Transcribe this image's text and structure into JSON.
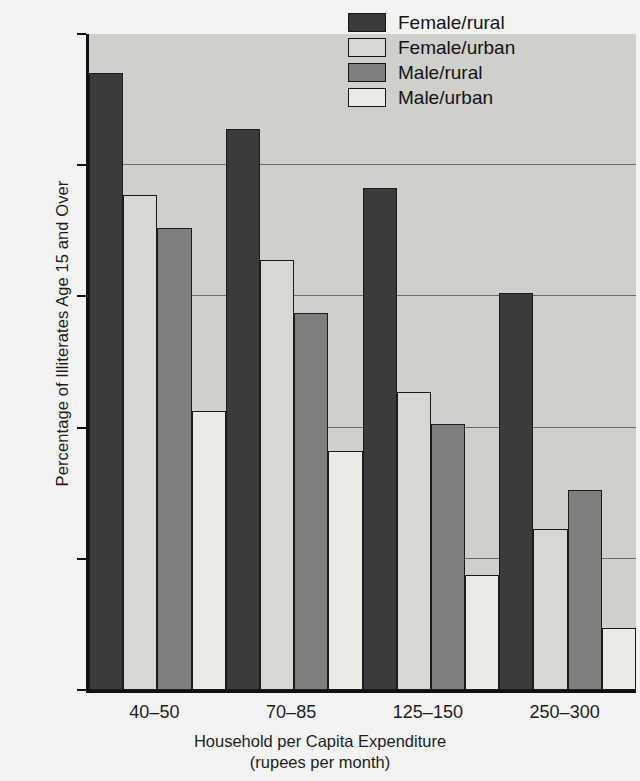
{
  "chart_data": {
    "type": "bar",
    "title": "",
    "xlabel": "Household per Capita Expenditure",
    "xlabel_sub": "(rupees per month)",
    "ylabel": "Percentage of Illiterates Age 15 and Over",
    "categories": [
      "40–50",
      "70–85",
      "125–150",
      "250–300"
    ],
    "series": [
      {
        "name": "Female/rural",
        "color": "#3b3b3b",
        "values": [
          94,
          85.5,
          76.5,
          60.5
        ]
      },
      {
        "name": "Female/urban",
        "color": "#d7d7d3",
        "values": [
          75.5,
          65.5,
          45.5,
          24.5
        ]
      },
      {
        "name": "Male/rural",
        "color": "#7e7e7c",
        "values": [
          70.5,
          57.5,
          40.5,
          30.5
        ]
      },
      {
        "name": "Male/urban",
        "color": "#eceae5",
        "values": [
          42.5,
          36.5,
          17.5,
          9.5
        ]
      }
    ],
    "ylim": [
      0,
      100
    ],
    "yticks": [
      0,
      20,
      40,
      60,
      80,
      100
    ],
    "ytick_labels": [
      "0",
      "20",
      "40",
      "60",
      "80",
      "100"
    ],
    "gridlines": [
      20,
      40,
      60,
      80
    ],
    "grid": true,
    "legend_position": "top-right",
    "plot_background": "#cfcfcc",
    "figure_background": "#f3f3f1",
    "axis_color": "#111111",
    "gridline_color": "#6c6c6a"
  },
  "legend": {
    "items": [
      {
        "label": "Female/rural",
        "color": "#3b3b3b"
      },
      {
        "label": "Female/urban",
        "color": "#d7d7d3"
      },
      {
        "label": "Male/rural",
        "color": "#7e7e7c"
      },
      {
        "label": "Male/urban",
        "color": "#eceae5"
      }
    ]
  }
}
